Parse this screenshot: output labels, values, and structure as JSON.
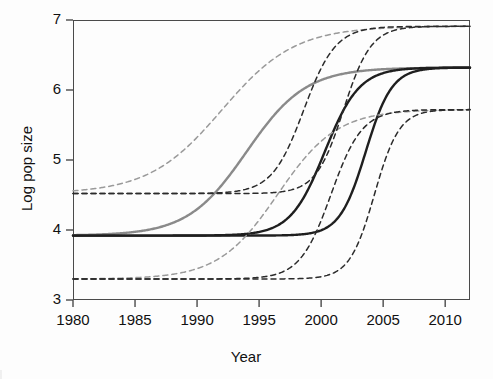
{
  "chart_data": {
    "type": "line",
    "title": "",
    "xlabel": "Year",
    "ylabel": "Log pop size",
    "xlim": [
      1980,
      2012
    ],
    "ylim": [
      3,
      7
    ],
    "xticks": [
      1980,
      1985,
      1990,
      1995,
      2000,
      2005,
      2010
    ],
    "yticks": [
      3,
      4,
      5,
      6,
      7
    ],
    "grid": false,
    "legend": "none",
    "colors": {
      "gray_fit": "#8a8a8a",
      "dark_fit": "#1f1f1f",
      "gray_band": "#9a9a9a",
      "dark_band": "#2b2b2b",
      "axis": "#4a4a4a"
    },
    "series": [
      {
        "name": "Gray fitted logistic curve",
        "style": "solid",
        "color": "#8a8a8a",
        "model": "logistic",
        "lower_asymptote": 3.92,
        "upper_asymptote": 6.32,
        "inflection_year": 1994.0,
        "rate": 0.42,
        "x": [
          1980,
          1982,
          1984,
          1986,
          1988,
          1990,
          1992,
          1994,
          1996,
          1998,
          2000,
          2002,
          2004,
          2006,
          2008,
          2010,
          2012
        ],
        "y": [
          3.93,
          3.97,
          4.03,
          4.15,
          4.35,
          4.68,
          5.14,
          5.62,
          6.0,
          6.2,
          6.28,
          6.31,
          6.32,
          6.32,
          6.32,
          6.32,
          6.32
        ]
      },
      {
        "name": "Dark fitted logistic curve (earlier)",
        "style": "solid",
        "color": "#1f1f1f",
        "model": "logistic",
        "lower_asymptote": 3.92,
        "upper_asymptote": 6.32,
        "inflection_year": 2000.3,
        "rate": 0.72,
        "x": [
          1980,
          1984,
          1988,
          1992,
          1994,
          1996,
          1998,
          1999,
          2000,
          2001,
          2002,
          2003,
          2004,
          2006,
          2008,
          2010,
          2012
        ],
        "y": [
          3.92,
          3.92,
          3.92,
          3.93,
          3.95,
          4.0,
          4.26,
          4.56,
          5.0,
          5.45,
          5.8,
          6.05,
          6.18,
          6.29,
          6.31,
          6.32,
          6.32
        ]
      },
      {
        "name": "Dark fitted logistic curve (later)",
        "style": "solid",
        "color": "#1f1f1f",
        "model": "logistic",
        "lower_asymptote": 3.92,
        "upper_asymptote": 6.32,
        "inflection_year": 2003.6,
        "rate": 0.95,
        "x": [
          1980,
          1988,
          1994,
          1998,
          2000,
          2001,
          2002,
          2003,
          2004,
          2005,
          2006,
          2007,
          2008,
          2010,
          2012
        ],
        "y": [
          3.92,
          3.92,
          3.92,
          3.93,
          3.96,
          4.02,
          4.2,
          4.68,
          5.4,
          5.9,
          6.15,
          6.26,
          6.3,
          6.32,
          6.32
        ]
      },
      {
        "name": "Gray band upper",
        "style": "dashed",
        "color": "#9a9a9a",
        "model": "logistic",
        "lower_asymptote": 4.52,
        "upper_asymptote": 6.91,
        "inflection_year": 1992.0,
        "rate": 0.34,
        "x": [
          1980,
          1984,
          1988,
          1992,
          1996,
          2000,
          2004,
          2008,
          2012
        ],
        "y": [
          4.55,
          4.7,
          5.1,
          5.72,
          6.35,
          6.72,
          6.86,
          6.9,
          6.91
        ]
      },
      {
        "name": "Gray band lower",
        "style": "dashed",
        "color": "#9a9a9a",
        "model": "logistic",
        "lower_asymptote": 3.3,
        "upper_asymptote": 5.72,
        "inflection_year": 1996.5,
        "rate": 0.42,
        "x": [
          1980,
          1984,
          1988,
          1992,
          1996,
          2000,
          2004,
          2008,
          2012
        ],
        "y": [
          3.31,
          3.37,
          3.52,
          3.9,
          4.5,
          5.2,
          5.58,
          5.69,
          5.72
        ]
      },
      {
        "name": "Dark band upper (earlier)",
        "style": "dashed",
        "color": "#2b2b2b",
        "model": "logistic",
        "lower_asymptote": 4.52,
        "upper_asymptote": 6.91,
        "inflection_year": 1998.6,
        "rate": 0.78,
        "x": [
          1980,
          1990,
          1994,
          1996,
          1998,
          1999,
          2000,
          2001,
          2002,
          2004,
          2008,
          2012
        ],
        "y": [
          4.52,
          4.53,
          4.6,
          4.78,
          5.2,
          5.6,
          6.0,
          6.4,
          6.65,
          6.85,
          6.91,
          6.91
        ]
      },
      {
        "name": "Dark band upper (later)",
        "style": "dashed",
        "color": "#2b2b2b",
        "model": "logistic",
        "lower_asymptote": 4.52,
        "upper_asymptote": 6.91,
        "inflection_year": 2001.8,
        "rate": 0.9,
        "x": [
          1980,
          1992,
          1996,
          1998,
          2000,
          2001,
          2002,
          2003,
          2004,
          2006,
          2009,
          2012
        ],
        "y": [
          4.52,
          4.53,
          4.58,
          4.72,
          5.2,
          5.65,
          6.1,
          6.45,
          6.68,
          6.86,
          6.91,
          6.91
        ]
      },
      {
        "name": "Dark band lower (earlier)",
        "style": "dashed",
        "color": "#2b2b2b",
        "model": "logistic",
        "lower_asymptote": 3.3,
        "upper_asymptote": 5.72,
        "inflection_year": 2000.8,
        "rate": 0.8,
        "x": [
          1980,
          1992,
          1996,
          1998,
          2000,
          2001,
          2002,
          2003,
          2004,
          2006,
          2009,
          2012
        ],
        "y": [
          3.3,
          3.3,
          3.33,
          3.42,
          3.85,
          4.3,
          4.8,
          5.18,
          5.42,
          5.65,
          5.71,
          5.72
        ]
      },
      {
        "name": "Dark band lower (later)",
        "style": "dashed",
        "color": "#2b2b2b",
        "model": "logistic",
        "lower_asymptote": 3.3,
        "upper_asymptote": 5.72,
        "inflection_year": 2004.3,
        "rate": 1.0,
        "x": [
          1980,
          1996,
          2000,
          2002,
          2003,
          2004,
          2005,
          2006,
          2007,
          2009,
          2012
        ],
        "y": [
          3.3,
          3.3,
          3.32,
          3.45,
          3.7,
          4.3,
          4.95,
          5.35,
          5.56,
          5.7,
          5.72
        ]
      }
    ]
  },
  "axes": {
    "xlabel": "Year",
    "ylabel": "Log pop size",
    "xticks": [
      "1980",
      "1985",
      "1990",
      "1995",
      "2000",
      "2005",
      "2010"
    ],
    "yticks": [
      "7",
      "6",
      "5",
      "4",
      "3"
    ]
  }
}
